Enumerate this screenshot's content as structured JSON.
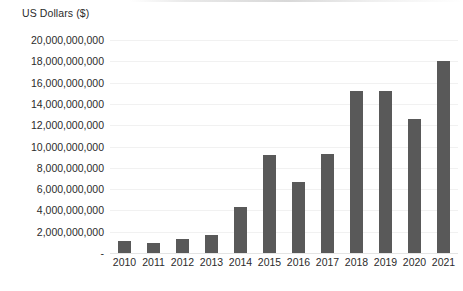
{
  "chart_data": {
    "type": "bar",
    "title": "",
    "xlabel": "",
    "ylabel": "US Dollars ($)",
    "categories": [
      "2010",
      "2011",
      "2012",
      "2013",
      "2014",
      "2015",
      "2016",
      "2017",
      "2018",
      "2019",
      "2020",
      "2021"
    ],
    "values": [
      1100000000,
      900000000,
      1300000000,
      1700000000,
      4300000000,
      9200000000,
      6700000000,
      9300000000,
      15200000000,
      15200000000,
      12600000000,
      18000000000
    ],
    "ylim": [
      0,
      20000000000
    ],
    "y_tick_values": [
      0,
      2000000000,
      4000000000,
      6000000000,
      8000000000,
      10000000000,
      12000000000,
      14000000000,
      16000000000,
      18000000000,
      20000000000
    ],
    "y_tick_labels": [
      "-",
      "2,000,000,000",
      "4,000,000,000",
      "6,000,000,000",
      "8,000,000,000",
      "10,000,000,000",
      "12,000,000,000",
      "14,000,000,000",
      "16,000,000,000",
      "18,000,000,000",
      "20,000,000,000"
    ],
    "grid": true,
    "legend": false,
    "bar_color": "#595959",
    "gridline_color": "#f1f1f1",
    "text_color": "#2b2b2b",
    "background_color": "#ffffff"
  }
}
